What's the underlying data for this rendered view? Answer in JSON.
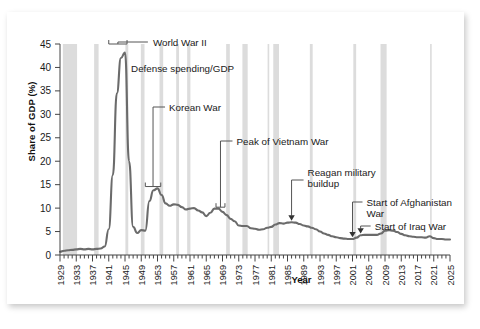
{
  "chart_data": {
    "type": "line",
    "title": "",
    "xlabel": "Year",
    "ylabel": "Share of GDP (%)",
    "xlim": [
      1929,
      2025
    ],
    "ylim": [
      0,
      45
    ],
    "yticks": [
      0,
      5,
      10,
      15,
      20,
      25,
      30,
      35,
      40,
      45
    ],
    "xticks": [
      1929,
      1933,
      1937,
      1941,
      1945,
      1949,
      1953,
      1957,
      1961,
      1965,
      1969,
      1973,
      1977,
      1981,
      1985,
      1989,
      1993,
      1997,
      2001,
      2005,
      2009,
      2013,
      2017,
      2021,
      2025
    ],
    "grid": false,
    "legend": "none",
    "series": [
      {
        "name": "Defense spending/GDP",
        "color": "#6b6b6b",
        "x": [
          1929,
          1930,
          1931,
          1932,
          1933,
          1934,
          1935,
          1936,
          1937,
          1938,
          1939,
          1940,
          1941,
          1942,
          1943,
          1944,
          1945,
          1946,
          1947,
          1948,
          1949,
          1950,
          1951,
          1952,
          1953,
          1954,
          1955,
          1956,
          1957,
          1958,
          1959,
          1960,
          1961,
          1962,
          1963,
          1964,
          1965,
          1966,
          1967,
          1968,
          1969,
          1970,
          1971,
          1972,
          1973,
          1974,
          1975,
          1976,
          1977,
          1978,
          1979,
          1980,
          1981,
          1982,
          1983,
          1984,
          1985,
          1986,
          1987,
          1988,
          1989,
          1990,
          1991,
          1992,
          1993,
          1994,
          1995,
          1996,
          1997,
          1998,
          1999,
          2000,
          2001,
          2002,
          2003,
          2004,
          2005,
          2006,
          2007,
          2008,
          2009,
          2010,
          2011,
          2012,
          2013,
          2014,
          2015,
          2016,
          2017,
          2018,
          2019,
          2020,
          2021,
          2022,
          2023,
          2024,
          2025
        ],
        "y": [
          0.7,
          0.9,
          1.0,
          1.1,
          1.2,
          1.3,
          1.2,
          1.3,
          1.2,
          1.3,
          1.4,
          1.8,
          5.5,
          17.0,
          34.5,
          42.0,
          43.2,
          20.0,
          6.0,
          4.7,
          5.3,
          5.2,
          11.5,
          13.8,
          14.2,
          12.8,
          11.0,
          10.5,
          10.8,
          10.7,
          10.2,
          9.7,
          9.9,
          10.0,
          9.5,
          9.1,
          8.3,
          9.0,
          9.9,
          9.9,
          9.2,
          8.5,
          7.7,
          7.2,
          6.3,
          6.2,
          6.2,
          5.7,
          5.6,
          5.4,
          5.5,
          5.8,
          6.0,
          6.5,
          6.8,
          6.7,
          6.9,
          7.0,
          6.9,
          6.6,
          6.3,
          6.1,
          5.8,
          5.5,
          5.0,
          4.6,
          4.3,
          4.0,
          3.8,
          3.6,
          3.5,
          3.4,
          3.4,
          3.7,
          4.2,
          4.3,
          4.3,
          4.3,
          4.3,
          4.6,
          5.2,
          5.3,
          5.2,
          4.9,
          4.5,
          4.2,
          4.0,
          3.9,
          3.8,
          3.8,
          3.7,
          4.0,
          3.6,
          3.4,
          3.4,
          3.3,
          3.3
        ]
      }
    ],
    "recession_bands": [
      [
        1929.7,
        1933.2
      ],
      [
        1937.4,
        1938.5
      ],
      [
        1945.1,
        1945.8
      ],
      [
        1948.9,
        1949.8
      ],
      [
        1953.5,
        1954.4
      ],
      [
        1957.6,
        1958.3
      ],
      [
        1960.3,
        1961.1
      ],
      [
        1969.9,
        1970.8
      ],
      [
        1973.9,
        1975.2
      ],
      [
        1980.1,
        1980.5
      ],
      [
        1981.5,
        1982.9
      ],
      [
        1990.5,
        1991.2
      ],
      [
        2001.2,
        2001.9
      ],
      [
        2007.9,
        2009.4
      ],
      [
        2020.1,
        2020.4
      ]
    ],
    "recession_band_color": "#dcdcdc",
    "annotations": [
      {
        "label": "World War II",
        "kind": "bracket",
        "x_start": 1941,
        "x_end": 1945.5,
        "y_value": 45.0
      },
      {
        "label": "Defense spending/GDP",
        "kind": "text",
        "x_value": 1946,
        "y_value": 39.0
      },
      {
        "label": "Korean War",
        "kind": "bracket",
        "x_start": 1950,
        "x_end": 1953.5,
        "y_value": 14.5
      },
      {
        "label": "Peak of Vietnam War",
        "kind": "bracket",
        "x_start": 1967.5,
        "x_end": 1969.5,
        "y_value": 10.0
      },
      {
        "label": "Reagan military buildup",
        "kind": "arrow",
        "x_value": 1986,
        "y_value": 7.0
      },
      {
        "label": "Start of Afghanistan War",
        "kind": "arrow",
        "x_value": 2001,
        "y_value": 3.4
      },
      {
        "label": "Start of Iraq War",
        "kind": "arrow",
        "x_value": 2003,
        "y_value": 4.2
      }
    ]
  },
  "axis": {
    "ytick_labels": [
      "45",
      "40",
      "35",
      "30",
      "25",
      "20",
      "15",
      "10",
      "5",
      "0"
    ],
    "xtick_labels": [
      "1929",
      "1933",
      "1937",
      "1941",
      "1945",
      "1949",
      "1953",
      "1957",
      "1961",
      "1965",
      "1969",
      "1973",
      "1977",
      "1981",
      "1985",
      "1989",
      "1993",
      "1997",
      "2001",
      "2005",
      "2009",
      "2013",
      "2017",
      "2021",
      "2025"
    ],
    "ylabel": "Share of GDP (%)",
    "xlabel": "Year"
  },
  "annotations_text": {
    "world_war_ii": "World War II",
    "defense_spending_gdp": "Defense spending/GDP",
    "korean_war": "Korean War",
    "peak_vietnam_war": "Peak of Vietnam War",
    "reagan_line1": "Reagan military",
    "reagan_line2": "buildup",
    "afghanistan_line1": "Start of Afghanistan",
    "afghanistan_line2": "War",
    "iraq_war": "Start of Iraq War"
  },
  "colors": {
    "line": "#6b6b6b",
    "recession_band": "#dcdcdc",
    "axis": "#444444",
    "text": "#1a1a1a",
    "card_bg": "#ffffff",
    "page_bg": "#ffffff"
  }
}
